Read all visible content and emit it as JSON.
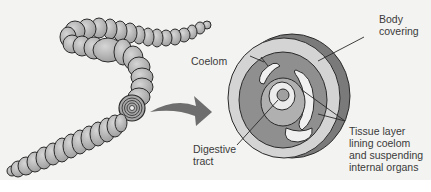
{
  "diagram": {
    "labels": {
      "coelom": "Coelom",
      "body_covering": "Body\ncovering",
      "digestive_tract": "Digestive\ntract",
      "tissue_layer": "Tissue layer\nlining coelom\nand suspending\ninternal organs"
    },
    "colors": {
      "background": "#f3f3f1",
      "worm_fill": "#b8b8b8",
      "worm_stroke": "#2a2a2a",
      "outer_ring": "#d4d4d4",
      "muscle_ring": "#8f8f8f",
      "coelom_space": "#f0f0f0",
      "arrow": "#6e6e6e",
      "text": "#3a3a3a"
    }
  }
}
